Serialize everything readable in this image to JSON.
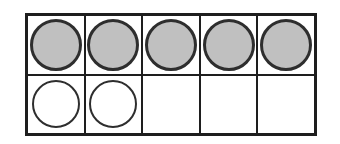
{
  "figure": {
    "name": "ten-frame",
    "rows": 2,
    "columns": 5,
    "filled_counters": 5,
    "open_counters": 2,
    "empty_cells": 3,
    "cells": [
      [
        "filled",
        "filled",
        "filled",
        "filled",
        "filled"
      ],
      [
        "open",
        "open",
        "none",
        "none",
        "none"
      ]
    ],
    "colors": {
      "background": "#ffffff",
      "frame_line": "#1e1e1e",
      "counter_outline": "#2e2e2e",
      "filled_fill": "#c0c0c0",
      "filled_dot": "#969696"
    }
  }
}
